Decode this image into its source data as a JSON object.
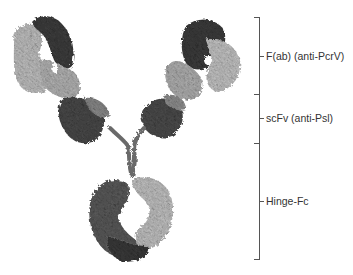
{
  "figure": {
    "colors": {
      "dark": "#3a3a3a",
      "mid": "#7a7a7a",
      "light": "#bdbdbd",
      "bracket": "#555555",
      "text": "#333333"
    },
    "labels": [
      {
        "id": "fab",
        "text": "F(ab) (anti-PcrV)"
      },
      {
        "id": "scfv",
        "text": "scFv (anti-Psl)"
      },
      {
        "id": "hinge",
        "text": "Hinge-Fc"
      }
    ]
  }
}
